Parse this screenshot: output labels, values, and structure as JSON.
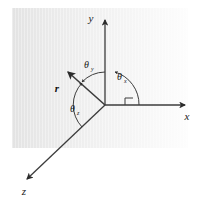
{
  "figure": {
    "background_color": "#ffffff",
    "panel": {
      "fill_start_color": "#e6e6e6",
      "fill_end_color": "#ffffff",
      "x": 12,
      "y": 8,
      "width": 176,
      "height": 140
    },
    "line_color": "#3c3c3c",
    "origin": {
      "x": 105,
      "y": 105
    }
  },
  "axes": [
    {
      "id": "y-axis",
      "label": "y",
      "label_x": 91,
      "label_y": 22,
      "from_x": 105,
      "from_y": 105,
      "to_x": 105,
      "to_y": 18
    },
    {
      "id": "x-axis",
      "label": "x",
      "label_x": 187,
      "label_y": 120,
      "from_x": 105,
      "from_y": 105,
      "to_x": 187,
      "to_y": 105
    },
    {
      "id": "z-axis",
      "label": "z",
      "label_x": 24,
      "label_y": 195,
      "from_x": 105,
      "from_y": 105,
      "to_x": 25,
      "to_y": 181
    }
  ],
  "vector": {
    "id": "position-vector",
    "label": "r",
    "label_x": 57,
    "label_y": 92,
    "from_x": 105,
    "from_y": 105,
    "to_x": 66,
    "to_y": 70
  },
  "angles": [
    {
      "id": "theta-y",
      "symbol": "θ",
      "subscript": "y",
      "label_x": 88,
      "label_y": 68,
      "description": "angle between the position vector r and the y axis"
    },
    {
      "id": "theta-x",
      "symbol": "θ",
      "subscript": "x",
      "label_x": 120,
      "label_y": 80,
      "description": "angle between the position vector r and the x axis"
    },
    {
      "id": "theta-z",
      "symbol": "θ",
      "subscript": "z",
      "label_x": 73,
      "label_y": 112,
      "description": "angle between the position vector r and the z axis"
    }
  ]
}
